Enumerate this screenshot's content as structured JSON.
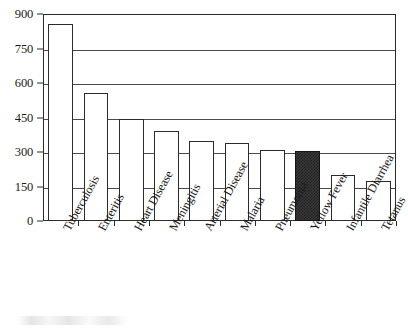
{
  "chart_data": {
    "type": "bar",
    "title": "",
    "subtitle": "",
    "xlabel": "",
    "ylabel": "",
    "ylim": [
      0,
      900
    ],
    "ytick_step": 150,
    "yticks": [
      0,
      150,
      300,
      450,
      600,
      750,
      900
    ],
    "ytick_labels": [
      "0",
      "150",
      "300",
      "450",
      "600",
      "750",
      "900"
    ],
    "grid": true,
    "grid_axis": "y",
    "legend": false,
    "legend_position": "none",
    "bar_style": {
      "default_fill": "#ffffff",
      "default_edge": "#2b2b2b",
      "highlight_fill": "#3a3a3a",
      "highlight_pattern": "dark-checker-dither",
      "highlight_category": "Yellow Fever"
    },
    "categories": [
      "Tuberculosis",
      "Enteritis",
      "Heart Disease",
      "Meningitis",
      "Arterial Disease",
      "Malaria",
      "Pneumonia",
      "Yellow Fever",
      "Infantile Diarrhea",
      "Tetanus"
    ],
    "values": [
      855,
      555,
      445,
      392,
      348,
      338,
      310,
      305,
      200,
      172
    ],
    "highlighted": [
      false,
      false,
      false,
      false,
      false,
      false,
      false,
      true,
      false,
      false
    ],
    "label_rotation_deg": -61
  }
}
